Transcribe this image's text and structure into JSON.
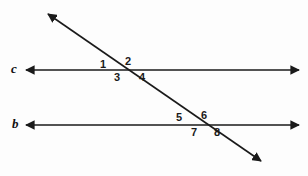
{
  "figure": {
    "background_color": "#fdfdfd",
    "stroke_color": "#1a1a1a"
  },
  "lines": {
    "upper": {
      "name": "c",
      "label": "c",
      "orientation": "horizontal",
      "y": 70,
      "x_start": 25,
      "x_end": 300,
      "arrowheads": "both"
    },
    "lower": {
      "name": "b",
      "label": "b",
      "orientation": "horizontal",
      "y": 125,
      "x_start": 25,
      "x_end": 300,
      "arrowheads": "both"
    },
    "transversal": {
      "name": "transversal",
      "label": "",
      "orientation": "diagonal",
      "x_start": 46,
      "y_start": 13,
      "x_end": 263,
      "y_end": 163,
      "arrowheads": "both"
    }
  },
  "intersections": {
    "upper": {
      "x": 121,
      "y": 70,
      "on_line": "c"
    },
    "lower": {
      "x": 199,
      "y": 125,
      "on_line": "b"
    }
  },
  "angle_labels": [
    {
      "id": "1",
      "text": "1",
      "x": 100,
      "y": 59,
      "position": "upper-left-of-c-intersection"
    },
    {
      "id": "2",
      "text": "2",
      "x": 125,
      "y": 56,
      "position": "upper-right-of-c-intersection"
    },
    {
      "id": "3",
      "text": "3",
      "x": 114,
      "y": 72,
      "position": "lower-left-of-c-intersection"
    },
    {
      "id": "4",
      "text": "4",
      "x": 139,
      "y": 72,
      "position": "lower-right-of-c-intersection"
    },
    {
      "id": "5",
      "text": "5",
      "x": 176,
      "y": 112,
      "position": "upper-left-of-b-intersection"
    },
    {
      "id": "6",
      "text": "6",
      "x": 201,
      "y": 110,
      "position": "upper-right-of-b-intersection"
    },
    {
      "id": "7",
      "text": "7",
      "x": 191,
      "y": 127,
      "position": "lower-left-of-b-intersection"
    },
    {
      "id": "8",
      "text": "8",
      "x": 214,
      "y": 127,
      "position": "lower-right-of-b-intersection"
    }
  ],
  "line_name_labels": [
    {
      "id": "c",
      "text": "c",
      "x": 11,
      "y": 62
    },
    {
      "id": "b",
      "text": "b",
      "x": 12,
      "y": 117
    }
  ],
  "chart_data": {
    "type": "diagram",
    "subtype": "geometry-transversal",
    "elements": {
      "lines": [
        "c",
        "b",
        "transversal"
      ],
      "angles": [
        "1",
        "2",
        "3",
        "4",
        "5",
        "6",
        "7",
        "8"
      ]
    }
  }
}
